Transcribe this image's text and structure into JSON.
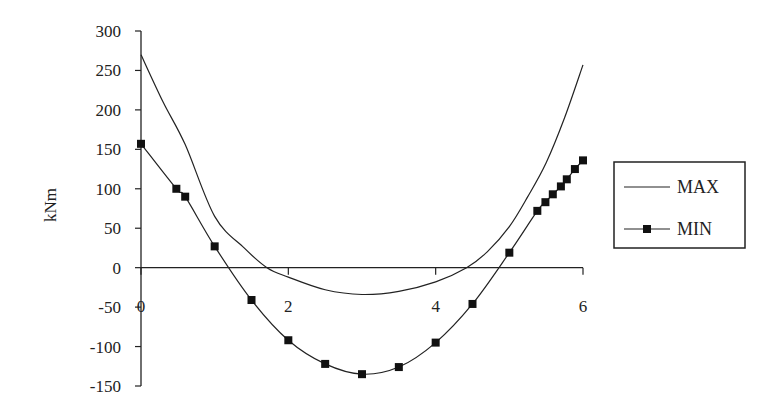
{
  "chart_data": {
    "type": "line",
    "title": "",
    "xlabel": "",
    "ylabel": "kNm",
    "xlim": [
      0,
      6
    ],
    "ylim": [
      -150,
      300
    ],
    "x_ticks": [
      0,
      2,
      4,
      6
    ],
    "x_tick_labels": [
      "0",
      "2",
      "4",
      "6"
    ],
    "y_ticks": [
      300,
      250,
      200,
      150,
      100,
      50,
      0,
      -50,
      -100,
      -150
    ],
    "y_tick_labels": [
      "300",
      "250",
      "200",
      "150",
      "100",
      "50",
      "0",
      "-50",
      "-100",
      "-150"
    ],
    "grid": false,
    "legend_position": "right",
    "series": [
      {
        "name": "MAX",
        "marker": "none",
        "x": [
          0,
          0.3,
          0.6,
          1.0,
          1.4,
          1.71,
          2.0,
          2.5,
          3.0,
          3.5,
          4.0,
          4.42,
          4.7,
          5.0,
          5.25,
          5.5,
          5.75,
          6.0
        ],
        "values": [
          270,
          210,
          156,
          65,
          25,
          0,
          -12,
          -28,
          -34,
          -30,
          -18,
          0,
          20,
          52,
          90,
          133,
          190,
          257
        ]
      },
      {
        "name": "MIN",
        "marker": "square",
        "x": [
          0,
          0.48,
          0.6,
          1.0,
          1.5,
          2.0,
          2.5,
          3.0,
          3.5,
          4.0,
          4.5,
          5.0,
          5.38,
          5.49,
          5.59,
          5.7,
          5.78,
          5.89,
          6.0
        ],
        "values": [
          157,
          100,
          90,
          27,
          -41,
          -92,
          -122,
          -135,
          -126,
          -95,
          -46,
          19,
          72,
          83,
          93,
          103,
          112,
          125,
          136
        ]
      }
    ]
  },
  "legend": {
    "items": [
      {
        "label": "MAX"
      },
      {
        "label": "MIN"
      }
    ]
  },
  "axes": {
    "ylabel": "kNm"
  }
}
